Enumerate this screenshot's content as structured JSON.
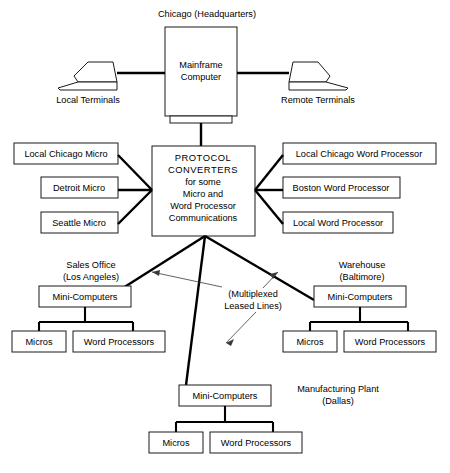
{
  "diagram": {
    "colors": {
      "background": "#ffffff",
      "line": "#000000",
      "box_stroke": "#1a1a1a",
      "leader": "#3a3a3a"
    },
    "headquarters": {
      "caption": "Chicago (Headquarters)",
      "mainframe_line1": "Mainframe",
      "mainframe_line2": "Computer",
      "local_terminals_label": "Local Terminals",
      "remote_terminals_label": "Remote Terminals"
    },
    "core": {
      "line1": "PROTOCOL",
      "line2": "CONVERTERS",
      "line3": "for some",
      "line4": "Micro and",
      "line5": "Word Processor",
      "line6": "Communications"
    },
    "left_nodes": [
      {
        "label": "Local Chicago Micro"
      },
      {
        "label": "Detroit Micro"
      },
      {
        "label": "Seattle Micro"
      }
    ],
    "right_nodes": [
      {
        "label": "Local Chicago Word Processor"
      },
      {
        "label": "Boston Word Processor"
      },
      {
        "label": "Local Word Processor"
      }
    ],
    "annotation": {
      "line1": "(Multiplexed",
      "line2": "Leased Lines)"
    },
    "sites": [
      {
        "id": "sales-office",
        "caption_line1": "Sales Office",
        "caption_line2": "(Los Angeles)",
        "hub_label": "Mini-Computers",
        "child_left": "Micros",
        "child_right": "Word Processors"
      },
      {
        "id": "warehouse",
        "caption_line1": "Warehouse",
        "caption_line2": "(Baltimore)",
        "hub_label": "Mini-Computers",
        "child_left": "Micros",
        "child_right": "Word Processors"
      },
      {
        "id": "manufacturing-plant",
        "caption_line1": "Manufacturing Plant",
        "caption_line2": "(Dallas)",
        "hub_label": "Mini-Computers",
        "child_left": "Micros",
        "child_right": "Word Processors"
      }
    ]
  }
}
